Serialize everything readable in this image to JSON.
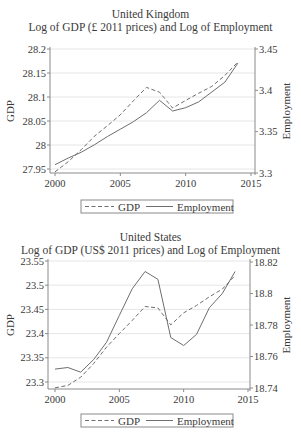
{
  "chart_data": [
    {
      "type": "line",
      "title": "United Kingdom",
      "subtitle": "Log of GDP (£ 2011 prices) and Log of Employment",
      "xlabel": "",
      "ylabel": "GDP",
      "y2label": "Employment",
      "x": [
        2000,
        2001,
        2002,
        2003,
        2004,
        2005,
        2006,
        2007,
        2008,
        2009,
        2010,
        2011,
        2012,
        2013,
        2014
      ],
      "xticks": [
        2000,
        2005,
        2010,
        2015
      ],
      "xlim": [
        2000,
        2015
      ],
      "ylim": [
        27.95,
        28.2
      ],
      "yticks": [
        27.95,
        28,
        28.05,
        28.1,
        28.15,
        28.2
      ],
      "ytick_labels": [
        "27.95",
        "28",
        "28.05",
        "28.1",
        "28.15",
        "28.2"
      ],
      "y2lim": [
        3.3,
        3.45
      ],
      "y2ticks": [
        3.3,
        3.35,
        3.4,
        3.45
      ],
      "y2tick_labels": [
        "3.3",
        "3.35",
        "3.4",
        "3.45"
      ],
      "grid": true,
      "legend_position": "bottom",
      "series": [
        {
          "name": "GDP",
          "axis": "left",
          "style": "dashed",
          "values": [
            27.944,
            27.965,
            27.99,
            28.018,
            28.04,
            28.063,
            28.092,
            28.12,
            28.11,
            28.077,
            28.093,
            28.108,
            28.122,
            28.145,
            28.173
          ]
        },
        {
          "name": "Employment",
          "axis": "right",
          "style": "solid",
          "values": [
            3.31,
            3.318,
            3.325,
            3.334,
            3.344,
            3.353,
            3.362,
            3.373,
            3.388,
            3.375,
            3.379,
            3.386,
            3.398,
            3.41,
            3.433
          ]
        }
      ]
    },
    {
      "type": "line",
      "title": "United States",
      "subtitle": "Log of GDP (US$ 2011 prices) and Log of Employment",
      "xlabel": "",
      "ylabel": "GDP",
      "y2label": "Employment",
      "x": [
        2000,
        2001,
        2002,
        2003,
        2004,
        2005,
        2006,
        2007,
        2008,
        2009,
        2010,
        2011,
        2012,
        2013,
        2014
      ],
      "xticks": [
        2000,
        2005,
        2010,
        2015
      ],
      "xlim": [
        2000,
        2015
      ],
      "ylim": [
        23.3,
        23.55
      ],
      "yticks": [
        23.3,
        23.35,
        23.4,
        23.45,
        23.5,
        23.55
      ],
      "ytick_labels": [
        "23.3",
        "23.35",
        "23.4",
        "23.45",
        "23.5",
        "23.55"
      ],
      "y2lim": [
        18.74,
        18.82
      ],
      "y2ticks": [
        18.74,
        18.76,
        18.78,
        18.8,
        18.82
      ],
      "y2tick_labels": [
        "18.74",
        "18.76",
        "18.78",
        "18.8",
        "18.82"
      ],
      "grid": true,
      "legend_position": "bottom",
      "series": [
        {
          "name": "GDP",
          "axis": "left",
          "style": "dashed",
          "values": [
            23.288,
            23.293,
            23.31,
            23.338,
            23.372,
            23.4,
            23.427,
            23.456,
            23.453,
            23.418,
            23.443,
            23.458,
            23.476,
            23.492,
            23.52
          ]
        },
        {
          "name": "Employment",
          "axis": "right",
          "style": "solid",
          "values": [
            18.752,
            18.753,
            18.75,
            18.758,
            18.769,
            18.786,
            18.803,
            18.814,
            18.809,
            18.772,
            18.767,
            18.774,
            18.791,
            18.8,
            18.814
          ]
        }
      ]
    }
  ],
  "figures": {
    "uk": {
      "title": "United Kingdom",
      "subtitle": "Log of GDP (£ 2011 prices) and Log of Employment",
      "legend": {
        "gdp": "GDP",
        "employment": "Employment"
      }
    },
    "us": {
      "title": "United States",
      "subtitle": "Log of GDP (US$ 2011 prices) and Log of Employment",
      "legend": {
        "gdp": "GDP",
        "employment": "Employment"
      }
    }
  },
  "colors": {
    "line": "#6e6e6e",
    "grid": "#e6e6e6",
    "axis": "#8a8a8a",
    "text": "#3a3a3a"
  }
}
